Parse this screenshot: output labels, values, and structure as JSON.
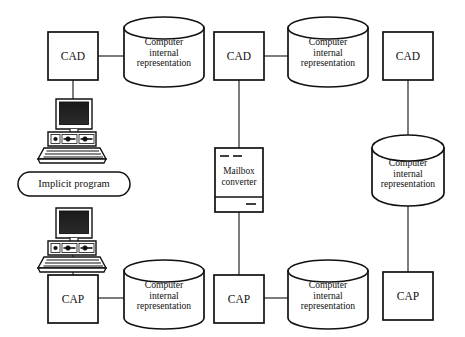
{
  "diagram": {
    "stroke_color": "#111111",
    "fill_color": "#ffffff",
    "background": "#ffffff",
    "columns": [
      {
        "id": "column-manual-exchange",
        "nodes": [
          {
            "name": "cad-box",
            "label": "CAD"
          },
          {
            "name": "cylinder-cad",
            "label": "Computer\ninternal\nrepresentation"
          },
          {
            "name": "workstation-top",
            "label": ""
          },
          {
            "name": "implicit-program-pill",
            "label": "Implicit program"
          },
          {
            "name": "workstation-bottom",
            "label": ""
          },
          {
            "name": "cap-box",
            "label": "CAP"
          },
          {
            "name": "cylinder-cap",
            "label": "Computer\ninternal\nrepresentation"
          }
        ]
      },
      {
        "id": "column-mailbox-converter",
        "nodes": [
          {
            "name": "cad-box",
            "label": "CAD"
          },
          {
            "name": "cylinder-cad",
            "label": "Computer\ninternal\nrepresentation"
          },
          {
            "name": "mailbox-converter-box",
            "label": "Mailbox\nconverter"
          },
          {
            "name": "cap-box",
            "label": "CAP"
          },
          {
            "name": "cylinder-cap",
            "label": "Computer\ninternal\nrepresentation"
          }
        ]
      },
      {
        "id": "column-shared-database",
        "nodes": [
          {
            "name": "cad-box",
            "label": "CAD"
          },
          {
            "name": "cylinder-shared",
            "label": "Computer\ninternal\nrepresentation"
          },
          {
            "name": "cap-box",
            "label": "CAP"
          }
        ]
      }
    ]
  },
  "labels": {
    "cad": "CAD",
    "cap": "CAP",
    "computer_internal_line1": "Computer",
    "computer_internal_line2": "internal",
    "computer_internal_line3": "representation",
    "implicit_program": "Implicit program",
    "mailbox_line1": "Mailbox",
    "mailbox_line2": "converter"
  },
  "nodes": {
    "col1_cad": "CAD",
    "col1_cad_cyl_l1": "Computer",
    "col1_cad_cyl_l2": "internal",
    "col1_cad_cyl_l3": "representation",
    "col1_implicit": "Implicit program",
    "col1_cap": "CAP",
    "col1_cap_cyl_l1": "Computer",
    "col1_cap_cyl_l2": "internal",
    "col1_cap_cyl_l3": "representation",
    "col2_cad": "CAD",
    "col2_cad_cyl_l1": "Computer",
    "col2_cad_cyl_l2": "internal",
    "col2_cad_cyl_l3": "representation",
    "col2_mailbox_l1": "Mailbox",
    "col2_mailbox_l2": "converter",
    "col2_cap": "CAP",
    "col2_cap_cyl_l1": "Computer",
    "col2_cap_cyl_l2": "internal",
    "col2_cap_cyl_l3": "representation",
    "col3_cad": "CAD",
    "col3_cyl_l1": "Computer",
    "col3_cyl_l2": "internal",
    "col3_cyl_l3": "representation",
    "col3_cap": "CAP"
  }
}
